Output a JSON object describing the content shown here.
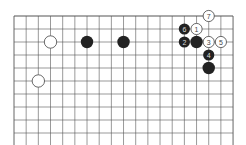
{
  "diagram": {
    "type": "go-board-fragment",
    "grid": {
      "columns": 19,
      "rows_visible": 10,
      "origin_x": 14,
      "origin_y": 16,
      "spacing_x": 12.17,
      "spacing_y": 13,
      "line_color": "#555555",
      "top_edge": true,
      "bottom_open": true
    },
    "stones": [
      {
        "color": "white",
        "col": 3,
        "row": 2,
        "label": ""
      },
      {
        "color": "white",
        "col": 2,
        "row": 5,
        "label": ""
      },
      {
        "color": "black",
        "col": 6,
        "row": 2,
        "label": ""
      },
      {
        "color": "black",
        "col": 9,
        "row": 2,
        "label": ""
      },
      {
        "color": "white",
        "col": 15,
        "row": 1,
        "label": "1"
      },
      {
        "color": "black",
        "col": 14,
        "row": 2,
        "label": "2"
      },
      {
        "color": "white",
        "col": 16,
        "row": 2,
        "label": "3"
      },
      {
        "color": "black",
        "col": 16,
        "row": 3,
        "label": "4"
      },
      {
        "color": "white",
        "col": 17,
        "row": 2,
        "label": "5"
      },
      {
        "color": "black",
        "col": 14,
        "row": 1,
        "label": "6"
      },
      {
        "color": "white",
        "col": 16,
        "row": 0,
        "label": "7"
      },
      {
        "color": "black",
        "col": 15,
        "row": 2,
        "label": ""
      },
      {
        "color": "black",
        "col": 16,
        "row": 4,
        "label": ""
      }
    ],
    "colors": {
      "black_stone": "#222222",
      "white_stone": "#ffffff",
      "white_stone_border": "#444444",
      "black_label": "#dddddd",
      "white_label": "#444444"
    }
  }
}
